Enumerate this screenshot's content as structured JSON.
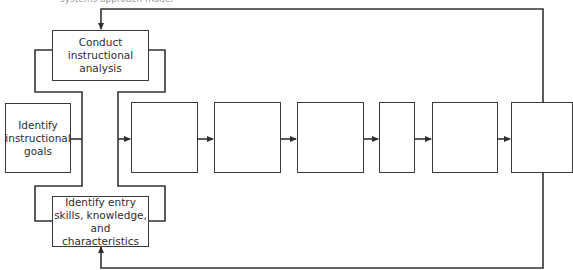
{
  "diagram": {
    "caption_partial": "systems approach model",
    "boxes": {
      "goals": {
        "label": "Identify instructional goals",
        "lines": [
          "Identify",
          "instructional",
          "goals"
        ]
      },
      "analysis": {
        "label": "Conduct instructional analysis",
        "lines": [
          "Conduct",
          "instructional",
          "analysis"
        ]
      },
      "entry": {
        "label": "Identify entry skills, knowledge, and characteristics",
        "lines": [
          "Identify entry",
          "skills, knowledge,",
          "and characteristics"
        ]
      },
      "step1": {
        "label": ""
      },
      "step2": {
        "label": ""
      },
      "step3": {
        "label": ""
      },
      "step4": {
        "label": ""
      },
      "step5": {
        "label": ""
      },
      "step6": {
        "label": ""
      }
    },
    "colors": {
      "line": "#3a3a3a",
      "background": "#ffffff"
    }
  }
}
